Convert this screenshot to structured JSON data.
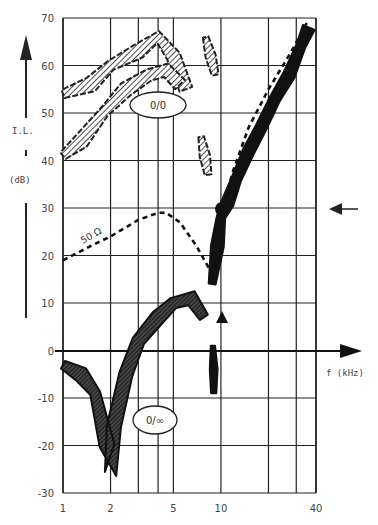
{
  "chart_data": {
    "type": "line",
    "title": "",
    "xlabel": "f (kHz)",
    "ylabel": "I.L. (dB)",
    "x_scale": "log",
    "xlim": [
      1,
      40
    ],
    "ylim": [
      -30,
      70
    ],
    "x_tick_labels": [
      "1",
      "2",
      "5",
      "10",
      "40"
    ],
    "x_tick_values": [
      1,
      2,
      5,
      10,
      40
    ],
    "x_grid_values": [
      1,
      2,
      3,
      4,
      5,
      10,
      20,
      30,
      40
    ],
    "y_tick_values": [
      70,
      60,
      50,
      40,
      30,
      20,
      10,
      0,
      -10,
      -20,
      -30
    ],
    "y_tick_labels": [
      "70",
      "60",
      "50",
      "40",
      "30",
      "20",
      "10",
      "0",
      "-10",
      "-20",
      "-30"
    ],
    "grid": true,
    "legend": null,
    "annotations": [
      {
        "text": "0/0",
        "shape": "ellipse",
        "x_khz": 3.6,
        "y_db": 50
      },
      {
        "text": "0/∞",
        "shape": "ellipse",
        "x_khz": 3.4,
        "y_db": -15
      },
      {
        "text": "50 Ω",
        "x_khz": 1.4,
        "y_db": 22
      },
      {
        "text": "← arrow marking 30 dB level",
        "x_khz": 60,
        "y_db": 30
      },
      {
        "text": "▲ marker at ~10 kHz",
        "x_khz": 9.8,
        "y_db": 8
      },
      {
        "text": "● point at ~10 kHz, 30 dB",
        "x_khz": 9.8,
        "y_db": 30
      }
    ],
    "series": [
      {
        "name": "50 Ω",
        "style": "dashed",
        "x": [
          1.0,
          1.5,
          2.0,
          3.0,
          4.0,
          4.5,
          5.5,
          7.0,
          8.5,
          9.3,
          10.0,
          12.0,
          15.0,
          20.0,
          28.0,
          35.0
        ],
        "values": [
          19,
          22,
          24,
          27.5,
          29,
          29,
          27,
          22,
          17,
          22,
          29,
          38,
          47,
          55,
          63,
          69
        ]
      },
      {
        "name": "measured band (solid, high-frequency)",
        "style": "filled-band",
        "x": [
          8.8,
          9.5,
          10.0,
          11.0,
          12.5,
          15.0,
          18.0,
          22.0,
          27.0,
          32.0,
          36.0
        ],
        "values": [
          14,
          22,
          28,
          31,
          36,
          42,
          47,
          53,
          58,
          64,
          68
        ]
      },
      {
        "name": "0/∞ band",
        "style": "hatched-band",
        "x": [
          1.0,
          1.3,
          1.6,
          1.9,
          2.0,
          2.1,
          2.5,
          3.0,
          4.0,
          5.0,
          6.5,
          7.8
        ],
        "values": [
          -3,
          -5,
          -9,
          -20,
          -26,
          -16,
          -5,
          2,
          7,
          10,
          11,
          7
        ]
      },
      {
        "name": "0/0 band (upper hatched)",
        "style": "hatched-band",
        "x": [
          1.0,
          1.5,
          2.0,
          3.0,
          4.0,
          5.0,
          6.0
        ],
        "values": [
          54,
          56,
          60,
          63,
          66,
          62,
          55
        ]
      },
      {
        "name": "0/0 band (lower hatched)",
        "style": "hatched-band",
        "x": [
          1.0,
          1.3,
          1.8,
          2.5,
          3.5,
          4.5,
          5.5
        ],
        "values": [
          41,
          44,
          50,
          55,
          58,
          59,
          56
        ]
      }
    ]
  },
  "axis": {
    "y_label_top": "I.L.",
    "y_label_unit": "(dB)",
    "x_label": "f (kHz)"
  },
  "labels": {
    "ellipse_top": "0/0",
    "ellipse_bottom": "0/∞",
    "series_50ohm": "50 Ω"
  }
}
